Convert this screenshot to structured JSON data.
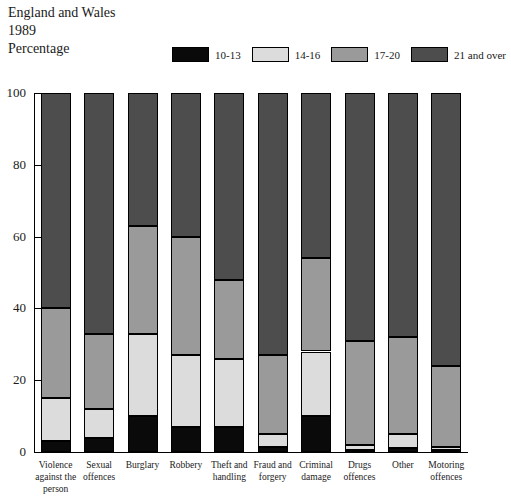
{
  "title": {
    "line1": "England and Wales",
    "line2": "1989",
    "line3": "Percentage"
  },
  "legend": {
    "position": "top",
    "items": [
      {
        "label": "10-13",
        "color": "#0a0a0a"
      },
      {
        "label": "14-16",
        "color": "#dcdcdc"
      },
      {
        "label": "17-20",
        "color": "#9a9a9a"
      },
      {
        "label": "21 and over",
        "color": "#4d4d4d"
      }
    ]
  },
  "chart_data": {
    "type": "bar",
    "stacked": true,
    "title": "England and Wales 1989 Percentage",
    "xlabel": "",
    "ylabel": "Percentage",
    "ylim": [
      0,
      100
    ],
    "yticks": [
      0,
      20,
      40,
      60,
      80,
      100
    ],
    "ytick_labels": [
      "0",
      "20",
      "40",
      "60",
      "80",
      "100"
    ],
    "grid": false,
    "legend_position": "top",
    "categories": [
      "Violence against the person",
      "Sexual offences",
      "Burglary",
      "Robbery",
      "Theft and handling",
      "Fraud and forgery",
      "Criminal damage",
      "Drugs offences",
      "Other",
      "Motoring offences"
    ],
    "category_labels": [
      [
        "Violence",
        "against the",
        "person"
      ],
      [
        "Sexual",
        "offences"
      ],
      [
        "Burglary"
      ],
      [
        "Robbery"
      ],
      [
        "Theft and",
        "handling"
      ],
      [
        "Fraud and",
        "forgery"
      ],
      [
        "Criminal",
        "damage"
      ],
      [
        "Drugs",
        "offences"
      ],
      [
        "Other"
      ],
      [
        "Motoring",
        "offences"
      ]
    ],
    "series": [
      {
        "name": "10-13",
        "color": "#0a0a0a",
        "values": [
          3,
          4,
          10,
          7,
          7,
          1.5,
          10,
          0.5,
          1,
          0.5
        ]
      },
      {
        "name": "14-16",
        "color": "#dcdcdc",
        "values": [
          12,
          8,
          23,
          20,
          19,
          3.5,
          18,
          1.5,
          4,
          1
        ]
      },
      {
        "name": "17-20",
        "color": "#9a9a9a",
        "values": [
          25,
          21,
          30,
          33,
          22,
          22,
          26,
          29,
          27,
          22.5
        ]
      },
      {
        "name": "21 and over",
        "color": "#4d4d4d",
        "values": [
          60,
          67,
          37,
          40,
          52,
          73,
          46,
          69,
          68,
          76
        ]
      }
    ],
    "cumulative_tops": [
      [
        3,
        15,
        40,
        100
      ],
      [
        4,
        12,
        33,
        100
      ],
      [
        10,
        33,
        63,
        100
      ],
      [
        7,
        27,
        60,
        100
      ],
      [
        7,
        26,
        48,
        100
      ],
      [
        1.5,
        5,
        27,
        100
      ],
      [
        10,
        28,
        54,
        100
      ],
      [
        0.5,
        2,
        31,
        100
      ],
      [
        1,
        5,
        32,
        100
      ],
      [
        0.5,
        1.5,
        24,
        100
      ]
    ]
  }
}
